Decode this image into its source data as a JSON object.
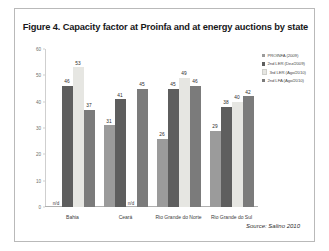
{
  "figure": {
    "title": "Figure 4. Capacity factor at Proinfa and at energy auctions by state",
    "source_note": "Source: Salino 2010"
  },
  "legend": {
    "entries": [
      {
        "label": "PROINFA (2009)",
        "color": "#9b9b9b"
      },
      {
        "label": "2nd LER (Dez/2009)",
        "color": "#5e5e5e"
      },
      {
        "label": "3rd LER (Ago/2010)",
        "color": "#e6e6e2"
      },
      {
        "label": "2nd LFA (Ago/2010)",
        "color": "#7b7b7b"
      }
    ]
  },
  "chart_data": {
    "type": "bar",
    "title": "Figure 4. Capacity factor at Proinfa and at energy auctions by state",
    "xlabel": "",
    "ylabel": "",
    "ylim": [
      0,
      60
    ],
    "yticks": [
      0,
      10,
      20,
      30,
      40,
      50,
      60
    ],
    "grid": false,
    "legend_position": "right",
    "categories": [
      "Bahia",
      "Ceará",
      "Rio Grande do Norte",
      "Rio Grande do Sul"
    ],
    "no_data_marker": "n/d",
    "series": [
      {
        "name": "PROINFA (2009)",
        "color": "#9b9b9b",
        "values": [
          null,
          31,
          26,
          29
        ]
      },
      {
        "name": "2nd LER (Dez/2009)",
        "color": "#5e5e5e",
        "values": [
          46,
          41,
          45,
          38
        ]
      },
      {
        "name": "3rd LER (Ago/2010)",
        "color": "#e6e6e2",
        "values": [
          53,
          null,
          49,
          40
        ]
      },
      {
        "name": "2nd LFA (Ago/2010)",
        "color": "#7b7b7b",
        "values": [
          37,
          45,
          46,
          42
        ]
      }
    ]
  }
}
